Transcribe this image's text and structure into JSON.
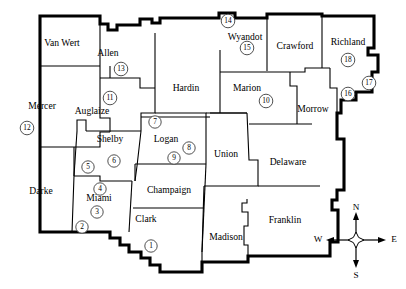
{
  "map": {
    "title": "County outline map with numbered site markers",
    "background_color": "#ffffff",
    "line_color": "#000000",
    "counties": [
      {
        "name": "Van Wert",
        "label_x": 62,
        "label_y": 44
      },
      {
        "name": "Allen",
        "label_x": 108,
        "label_y": 54
      },
      {
        "name": "Mercer",
        "label_x": 42,
        "label_y": 107
      },
      {
        "name": "Auglaize",
        "label_x": 92,
        "label_y": 112
      },
      {
        "name": "Hardin",
        "label_x": 186,
        "label_y": 89
      },
      {
        "name": "Wyandot",
        "label_x": 245,
        "label_y": 38
      },
      {
        "name": "Crawford",
        "label_x": 295,
        "label_y": 47
      },
      {
        "name": "Richland",
        "label_x": 348,
        "label_y": 43
      },
      {
        "name": "Marion",
        "label_x": 247,
        "label_y": 89
      },
      {
        "name": "Morrow",
        "label_x": 313,
        "label_y": 110
      },
      {
        "name": "Shelby",
        "label_x": 110,
        "label_y": 140
      },
      {
        "name": "Logan",
        "label_x": 166,
        "label_y": 140
      },
      {
        "name": "Union",
        "label_x": 226,
        "label_y": 155
      },
      {
        "name": "Delaware",
        "label_x": 288,
        "label_y": 163
      },
      {
        "name": "Darke",
        "label_x": 41,
        "label_y": 192
      },
      {
        "name": "Miami",
        "label_x": 99,
        "label_y": 199
      },
      {
        "name": "Champaign",
        "label_x": 169,
        "label_y": 191
      },
      {
        "name": "Clark",
        "label_x": 146,
        "label_y": 220
      },
      {
        "name": "Madison",
        "label_x": 226,
        "label_y": 238
      },
      {
        "name": "Franklin",
        "label_x": 285,
        "label_y": 221
      }
    ],
    "markers": [
      {
        "id": "1",
        "x": 151,
        "y": 246
      },
      {
        "id": "2",
        "x": 82,
        "y": 227
      },
      {
        "id": "3",
        "x": 97,
        "y": 212
      },
      {
        "id": "4",
        "x": 100,
        "y": 189
      },
      {
        "id": "5",
        "x": 88,
        "y": 167
      },
      {
        "id": "6",
        "x": 114,
        "y": 161
      },
      {
        "id": "7",
        "x": 155,
        "y": 122
      },
      {
        "id": "8",
        "x": 189,
        "y": 148
      },
      {
        "id": "9",
        "x": 174,
        "y": 158
      },
      {
        "id": "10",
        "x": 266,
        "y": 101
      },
      {
        "id": "11",
        "x": 110,
        "y": 98
      },
      {
        "id": "12",
        "x": 27,
        "y": 128
      },
      {
        "id": "13",
        "x": 121,
        "y": 69
      },
      {
        "id": "14",
        "x": 228,
        "y": 21
      },
      {
        "id": "15",
        "x": 247,
        "y": 48
      },
      {
        "id": "16",
        "x": 348,
        "y": 94
      },
      {
        "id": "17",
        "x": 369,
        "y": 83
      },
      {
        "id": "18",
        "x": 348,
        "y": 60
      }
    ],
    "compass": {
      "center_x": 356,
      "center_y": 240,
      "north_label": "N",
      "south_label": "S",
      "east_label": "E",
      "west_label": "W"
    }
  }
}
